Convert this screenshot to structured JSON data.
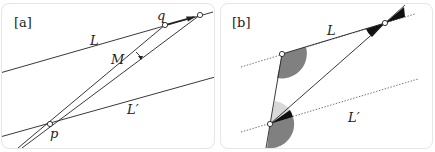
{
  "panel_a": {
    "tag": "[a]",
    "labels": {
      "L": "L",
      "M": "M",
      "Lprime": "L′",
      "p": "p",
      "q": "q"
    }
  },
  "panel_b": {
    "tag": "[b]",
    "labels": {
      "L": "L",
      "Lprime": "L′"
    }
  },
  "colors": {
    "line": "#222222",
    "dashed": "#555555",
    "wedge_dark": "#808080",
    "wedge_light": "#d8d8d8",
    "wedge_black": "#111111",
    "border": "#e6e6e6"
  }
}
